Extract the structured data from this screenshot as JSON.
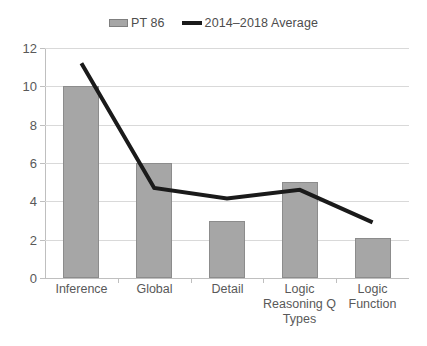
{
  "chart_data": {
    "type": "bar",
    "title": "",
    "xlabel": "",
    "ylabel": "",
    "ylim": [
      0,
      12
    ],
    "ytick_step": 2,
    "ytick_labels": [
      "0",
      "2",
      "4",
      "6",
      "8",
      "10",
      "12"
    ],
    "grid": true,
    "legend_position": "top-center",
    "categories": [
      "Inference",
      "Global",
      "Detail",
      "Logic Reasoning Q Types",
      "Logic Function"
    ],
    "category_label_lines": [
      [
        "Inference"
      ],
      [
        "Global"
      ],
      [
        "Detail"
      ],
      [
        "Logic",
        "Reasoning Q",
        "Types"
      ],
      [
        "Logic",
        "Function"
      ]
    ],
    "series": [
      {
        "name": "PT 86",
        "type": "bar",
        "color": "#a6a6a6",
        "border_color": "#8c8c8c",
        "values": [
          10,
          6,
          3,
          5,
          2.1
        ]
      },
      {
        "name": "2014–2018 Average",
        "type": "line",
        "color": "#1a1a1a",
        "values": [
          11.2,
          4.7,
          4.15,
          4.6,
          2.9
        ]
      }
    ]
  },
  "legend": {
    "entries": [
      {
        "label": "PT 86",
        "icon": "bar-swatch-icon",
        "color": "#a6a6a6"
      },
      {
        "label": "2014–2018 Average",
        "icon": "line-swatch-icon",
        "color": "#1a1a1a"
      }
    ]
  },
  "colors": {
    "bar_fill": "#a6a6a6",
    "bar_border": "#8c8c8c",
    "line": "#1a1a1a",
    "gridline": "#d9d9d9",
    "axis": "#bfbfbf",
    "text": "#595959",
    "background": "#ffffff"
  }
}
